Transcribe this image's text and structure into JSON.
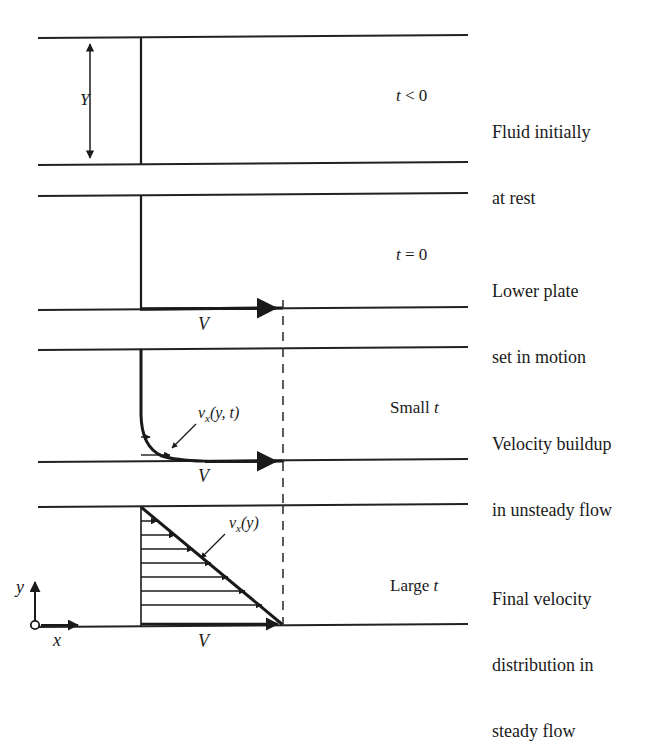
{
  "figure": {
    "caption_rows": [
      {
        "id": "row-1",
        "time_label": "t < 0",
        "time_prefix": "",
        "time_italic": "t",
        "time_rest": " < 0",
        "description_lines": [
          "Fluid initially",
          "at rest"
        ],
        "gap_label": "Y",
        "velocity_label": "",
        "profile_label": ""
      },
      {
        "id": "row-2",
        "time_label": "t = 0",
        "time_italic": "t",
        "time_rest": " = 0",
        "description_lines": [
          "Lower plate",
          "set in motion"
        ],
        "gap_label": "",
        "velocity_label": "V",
        "profile_label": ""
      },
      {
        "id": "row-3",
        "time_label": "Small t",
        "time_prefix": "Small ",
        "time_italic": "t",
        "time_rest": "",
        "description_lines": [
          "Velocity buildup",
          "in unsteady flow"
        ],
        "gap_label": "",
        "velocity_label": "V",
        "profile_label": "v_x(y, t)"
      },
      {
        "id": "row-4",
        "time_label": "Large t",
        "time_prefix": "Large ",
        "time_italic": "t",
        "time_rest": "",
        "description_lines": [
          "Final velocity",
          "distribution in",
          "steady flow"
        ],
        "gap_label": "",
        "velocity_label": "V",
        "profile_label": "v_x(y)"
      }
    ],
    "axes": {
      "y_label": "y",
      "x_label": "x",
      "origin_marker": "open-circle"
    },
    "symbols": {
      "gap": "Y",
      "plate_velocity": "V",
      "velocity_unsteady_base": "v",
      "velocity_unsteady_sub": "x",
      "velocity_unsteady_args": "(y, t)",
      "velocity_steady_base": "v",
      "velocity_steady_sub": "x",
      "velocity_steady_args": "(y)"
    },
    "colors": {
      "ink": "#1a1a1a",
      "plate": "#222222",
      "background": "#ffffff",
      "dashed": "#333333"
    },
    "geometry": {
      "panels": [
        {
          "top": 38,
          "bottom": 163
        },
        {
          "top": 194,
          "bottom": 308
        },
        {
          "top": 348,
          "bottom": 460
        },
        {
          "top": 505,
          "bottom": 625
        }
      ],
      "plate_x_start": 38,
      "plate_x_end": 468,
      "wall_x": 141,
      "dashed_x": 283,
      "arrow_count_steady": 8
    }
  }
}
